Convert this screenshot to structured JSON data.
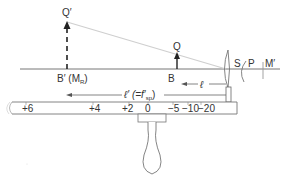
{
  "diagram": {
    "title": "",
    "colors": {
      "line": "#555555",
      "text": "#333333",
      "ray": "#c8c8c8",
      "background": "#ffffff"
    },
    "labels": {
      "q_prime": "Q′",
      "q": "Q",
      "b": "B",
      "b_prime": "B′ (M",
      "b_prime_sub": "R",
      "b_prime_close": ")",
      "s": "S",
      "p": "P",
      "m_prime": "M′",
      "ell": "ℓ",
      "ell_prime": "ℓ′ (=f′",
      "ell_prime_sub": "sp",
      "ell_prime_close": ")"
    },
    "ruler": {
      "ticks": [
        "+6",
        "+4",
        "+2",
        "0",
        "−5",
        "−10",
        "−20"
      ]
    }
  }
}
